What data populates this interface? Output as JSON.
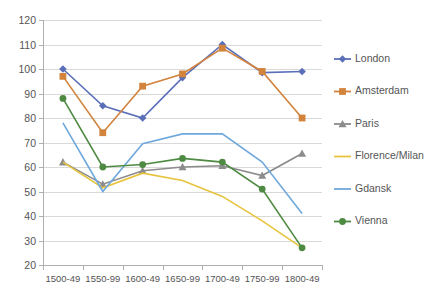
{
  "chart_data": {
    "type": "line",
    "title": "",
    "subtitle": "",
    "xlabel": "",
    "ylabel": "",
    "ylim": [
      20,
      120
    ],
    "ytick_step": 10,
    "grid": true,
    "legend_position": "right",
    "categories": [
      "1500-49",
      "1550-99",
      "1600-49",
      "1650-99",
      "1700-49",
      "1750-99",
      "1800-49"
    ],
    "yticks": [
      "20",
      "30",
      "40",
      "50",
      "60",
      "70",
      "80",
      "90",
      "100",
      "110",
      "120"
    ],
    "series": [
      {
        "name": "London",
        "color": "#5b6fb8",
        "marker": "diamond",
        "values": [
          100,
          85,
          80,
          96.5,
          110,
          98.5,
          99
        ]
      },
      {
        "name": "Amsterdam",
        "color": "#d2833c",
        "marker": "square",
        "values": [
          97,
          74,
          93,
          98,
          108.5,
          99,
          80
        ]
      },
      {
        "name": "Paris",
        "color": "#8c8c8c",
        "marker": "triangle",
        "values": [
          62,
          53,
          58.5,
          60,
          60.5,
          56.5,
          65.5
        ]
      },
      {
        "name": "Florence/Milan",
        "color": "#e8c33c",
        "marker": "none",
        "values": [
          62,
          51.5,
          57.5,
          54.5,
          48,
          38,
          27
        ]
      },
      {
        "name": "Gdansk",
        "color": "#6fa8dc",
        "marker": "none",
        "values": [
          78,
          50,
          69.5,
          73.5,
          73.5,
          62,
          41
        ]
      },
      {
        "name": "Vienna",
        "color": "#4e8a42",
        "marker": "circle",
        "values": [
          88,
          60,
          61,
          63.5,
          62,
          51,
          27
        ]
      }
    ]
  },
  "legend": {
    "items": [
      {
        "label": "London"
      },
      {
        "label": "Amsterdam"
      },
      {
        "label": "Paris"
      },
      {
        "label": "Florence/Milan"
      },
      {
        "label": "Gdansk"
      },
      {
        "label": "Vienna"
      }
    ]
  }
}
